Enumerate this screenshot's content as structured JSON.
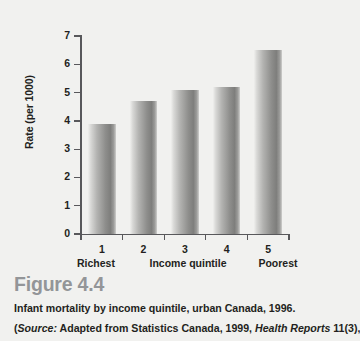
{
  "figure": {
    "number_label": "Figure 4.4",
    "caption": "Infant mortality by income quintile, urban Canada, 1996.",
    "source_prefix": "(",
    "source_italic_label": "Source:",
    "source_text_a": " Adapted from Statistics Canada, 1999, ",
    "source_italic_journal": "Health Reports",
    "source_text_b": " 11(3),",
    "title_color": "#939598",
    "text_color": "#231f20",
    "background_color": "#f1f1ef"
  },
  "chart_data": {
    "type": "bar",
    "title": "Infant mortality by income quintile, urban Canada, 1996.",
    "xlabel": "Income quintile",
    "ylabel": "Rate (per 1000)",
    "categories": [
      "1",
      "2",
      "3",
      "4",
      "5"
    ],
    "values": [
      3.9,
      4.7,
      5.1,
      5.2,
      6.5
    ],
    "ylim": [
      0,
      7
    ],
    "yticks": [
      "0",
      "1",
      "2",
      "3",
      "4",
      "5",
      "6",
      "7"
    ],
    "xticks": [
      "1",
      "2",
      "3",
      "4",
      "5"
    ],
    "x_end_labels": {
      "low": "Richest",
      "middle": "Income quintile",
      "high": "Poorest"
    },
    "grid": false,
    "legend": null,
    "bar_color_light": "#efefed",
    "bar_color_dark": "#7e7e7c",
    "axis_color": "#58585b"
  }
}
